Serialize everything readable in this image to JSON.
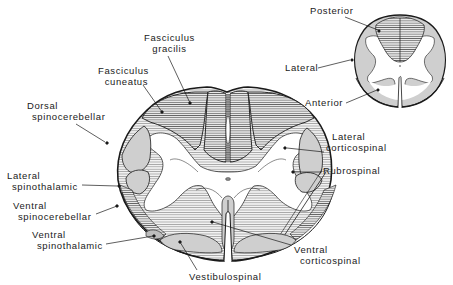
{
  "diagram": {
    "type": "anatomical cross-section",
    "colors": {
      "background": "#ffffff",
      "outline": "#1a1a1a",
      "tract_fill": "#cfcfcf",
      "hatch": "#555555",
      "gray_matter": "#ffffff"
    },
    "main_labels": {
      "fasciculus_gracilis": [
        "Fasciculus",
        "gracilis"
      ],
      "fasciculus_cuneatus": [
        "Fasciculus",
        "cuneatus"
      ],
      "dorsal_spinocerebellar": [
        "Dorsal",
        "spinocerebellar"
      ],
      "lateral_spinothalamic": [
        "Lateral",
        "spinothalamic"
      ],
      "ventral_spinocerebellar": [
        "Ventral",
        "spinocerebellar"
      ],
      "ventral_spinothalamic": [
        "Ventral",
        "spinothalamic"
      ],
      "vestibulospinal": [
        "Vestibulospinal"
      ],
      "ventral_corticospinal": [
        "Ventral",
        "corticospinal"
      ],
      "rubrospinal": [
        "Rubrospinal"
      ],
      "lateral_corticospinal": [
        "Lateral",
        "corticospinal"
      ]
    },
    "inset_labels": {
      "posterior": "Posterior",
      "lateral": "Lateral",
      "anterior": "Anterior"
    }
  }
}
